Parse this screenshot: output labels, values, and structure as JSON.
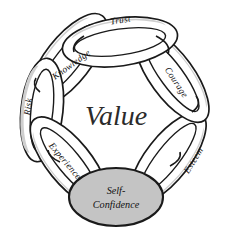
{
  "diagram": {
    "type": "interlocking-ring-cycle",
    "center_label": "Value",
    "hub": {
      "name": "self-confidence-node",
      "line1": "Self-",
      "line2": "Confidence"
    },
    "rings": [
      {
        "id": "trust",
        "label": "Trust",
        "position": "top"
      },
      {
        "id": "courage",
        "label": "Courage",
        "position": "upper-right"
      },
      {
        "id": "esteem",
        "label": "Esteem",
        "position": "lower-right"
      },
      {
        "id": "experience",
        "label": "Experience",
        "position": "lower-left"
      },
      {
        "id": "risk",
        "label": "Risk",
        "position": "left"
      },
      {
        "id": "knowledge",
        "label": "Knowledge",
        "position": "upper-left"
      }
    ],
    "colors": {
      "background": "#ffffff",
      "outline": "#1a1a1a",
      "ring_fill": "#ffffff",
      "ring_shade": "#b9b9b9",
      "hub_fill": "#c4c4c4",
      "text": "#111111"
    }
  }
}
